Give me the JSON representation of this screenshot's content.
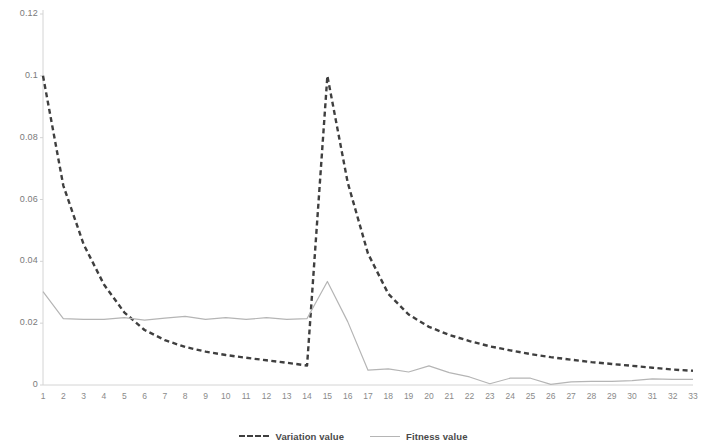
{
  "chart_data": {
    "type": "line",
    "title": "",
    "xlabel": "",
    "ylabel": "",
    "xlim": [
      1,
      33
    ],
    "ylim": [
      0,
      0.12
    ],
    "grid": false,
    "legend_position": "bottom",
    "y_ticks": [
      "0",
      "0.02",
      "0.04",
      "0.06",
      "0.08",
      "0.1",
      "0.12"
    ],
    "y_tick_values": [
      0,
      0.02,
      0.04,
      0.06,
      0.08,
      0.1,
      0.12
    ],
    "x_ticks": [
      "1",
      "2",
      "3",
      "4",
      "5",
      "6",
      "7",
      "8",
      "9",
      "10",
      "11",
      "12",
      "13",
      "14",
      "15",
      "16",
      "17",
      "18",
      "19",
      "20",
      "21",
      "22",
      "23",
      "24",
      "25",
      "26",
      "27",
      "28",
      "29",
      "30",
      "31",
      "32",
      "33"
    ],
    "x": [
      1,
      2,
      3,
      4,
      5,
      6,
      7,
      8,
      9,
      10,
      11,
      12,
      13,
      14,
      15,
      16,
      17,
      18,
      19,
      20,
      21,
      22,
      23,
      24,
      25,
      26,
      27,
      28,
      29,
      30,
      31,
      32,
      33
    ],
    "series": [
      {
        "name": "Variation value",
        "style": "dashed",
        "color": "#3f3f3f",
        "values": [
          0.1,
          0.0645,
          0.0455,
          0.0325,
          0.0235,
          0.0178,
          0.0145,
          0.0123,
          0.0108,
          0.0097,
          0.0088,
          0.008,
          0.0072,
          0.0063,
          0.1,
          0.0655,
          0.0425,
          0.0295,
          0.0228,
          0.0188,
          0.0162,
          0.0142,
          0.0125,
          0.0112,
          0.01,
          0.009,
          0.0082,
          0.0074,
          0.0068,
          0.0062,
          0.0056,
          0.005,
          0.0046
        ]
      },
      {
        "name": "Fitness value",
        "style": "solid",
        "color": "#b5b5b5",
        "values": [
          0.0302,
          0.0215,
          0.0212,
          0.0212,
          0.0218,
          0.021,
          0.0216,
          0.0222,
          0.0212,
          0.0218,
          0.0212,
          0.0218,
          0.0212,
          0.0215,
          0.0335,
          0.0205,
          0.0048,
          0.0052,
          0.0042,
          0.0062,
          0.004,
          0.0026,
          0.0004,
          0.0022,
          0.0022,
          0.0002,
          0.001,
          0.0012,
          0.0012,
          0.0014,
          0.002,
          0.0018,
          0.0018
        ]
      }
    ],
    "legend": [
      {
        "label": "Variation value",
        "style": "dashed",
        "color": "#3f3f3f"
      },
      {
        "label": "Fitness value",
        "style": "solid",
        "color": "#b5b5b5"
      }
    ],
    "axis_color": "#d4d4d4"
  }
}
